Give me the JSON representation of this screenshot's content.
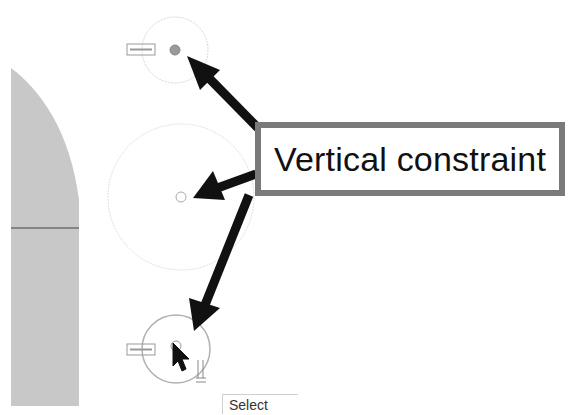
{
  "callout": {
    "label": "Vertical constraint",
    "border_color": "#7a7a7a"
  },
  "tooltip": {
    "label": "Select"
  },
  "sketch": {
    "profile_fill": "#c8c8c8",
    "circles": [
      {
        "name": "top-circle",
        "cx": 175,
        "cy": 50,
        "r": 33,
        "point": "filled"
      },
      {
        "name": "middle-circle",
        "cx": 181,
        "cy": 197,
        "r": 73,
        "point": "hollow"
      },
      {
        "name": "bottom-circle",
        "cx": 176,
        "cy": 349,
        "r": 34,
        "point": "hollow-selected"
      }
    ],
    "constraint_glyphs": [
      "vertical-constraint-top",
      "vertical-constraint-bottom"
    ]
  },
  "arrows": [
    {
      "name": "arrow-to-top-circle"
    },
    {
      "name": "arrow-to-middle-circle"
    },
    {
      "name": "arrow-to-bottom-circle"
    }
  ]
}
